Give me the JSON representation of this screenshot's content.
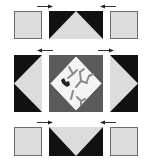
{
  "diagram": {
    "type": "quilt-block-assembly",
    "grid": "3x3",
    "colors": {
      "light": "#dcdcdc",
      "dark": "#111111",
      "medium": "#5a5a5a",
      "center_fabric": "#f4f4f4",
      "motif": "#8a8a8a",
      "outline": "#6e6e6e"
    },
    "rows": [
      {
        "name": "top-row",
        "pieces": [
          "corner-square",
          "flying-geese-point-up",
          "corner-square"
        ],
        "pressing_arrows": [
          "right",
          "left"
        ]
      },
      {
        "name": "middle-row",
        "pieces": [
          "flying-geese-point-left",
          "center-square-in-square",
          "flying-geese-point-right"
        ],
        "pressing_arrows": [
          "left",
          "right"
        ]
      },
      {
        "name": "bottom-row",
        "pieces": [
          "corner-square",
          "flying-geese-point-down",
          "corner-square"
        ],
        "pressing_arrows": [
          "right",
          "left"
        ]
      }
    ]
  }
}
